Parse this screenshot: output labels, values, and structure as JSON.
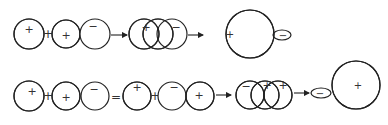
{
  "diagram": {
    "hatch_color": "#222222",
    "line_color": "#222222",
    "rows": [
      {
        "id": "row-1",
        "stages": [
          {
            "type": "circle",
            "fill": "hatched",
            "sign": "+"
          },
          {
            "type": "operator",
            "symbol": "+"
          },
          {
            "type": "circle",
            "fill": "hatched",
            "sign": "+"
          },
          {
            "type": "circle",
            "fill": "white",
            "sign": "−"
          },
          {
            "type": "arrow"
          },
          {
            "type": "overlap-group",
            "members": [
              {
                "fill": "hatched",
                "sign": "+"
              },
              {
                "fill": "hatched",
                "sign": ""
              },
              {
                "fill": "white",
                "sign": "−"
              }
            ]
          },
          {
            "type": "arrow"
          },
          {
            "type": "large-circle",
            "fill": "hatched",
            "sign": "+",
            "lobe_sign": "−"
          }
        ]
      },
      {
        "id": "row-2",
        "stages": [
          {
            "type": "circle",
            "fill": "hatched",
            "sign": "+"
          },
          {
            "type": "operator",
            "symbol": "+"
          },
          {
            "type": "circle",
            "fill": "hatched",
            "sign": "+"
          },
          {
            "type": "circle",
            "fill": "white",
            "sign": "−"
          },
          {
            "type": "operator",
            "symbol": "="
          },
          {
            "type": "circle",
            "fill": "hatched",
            "sign": "+"
          },
          {
            "type": "operator",
            "symbol": "+"
          },
          {
            "type": "circle",
            "fill": "white",
            "sign": "−"
          },
          {
            "type": "circle",
            "fill": "hatched",
            "sign": "+"
          },
          {
            "type": "arrow"
          },
          {
            "type": "overlap-group",
            "members": [
              {
                "fill": "white",
                "sign": "−"
              },
              {
                "fill": "hatched",
                "sign": "+"
              },
              {
                "fill": "hatched",
                "sign": "+"
              }
            ]
          },
          {
            "type": "arrow"
          },
          {
            "type": "large-circle",
            "fill": "hatched",
            "sign": "+",
            "lobe_sign": "−"
          }
        ]
      }
    ],
    "labels": {
      "plus": "+",
      "minus": "−",
      "equals": "="
    }
  }
}
